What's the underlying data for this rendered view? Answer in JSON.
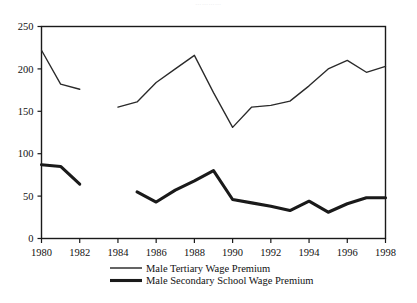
{
  "figure": {
    "faint_top_text": "…………",
    "background": "#ffffff",
    "ink_color": "#1a1a1a"
  },
  "chart_data": {
    "type": "line",
    "title": "",
    "xlabel": "",
    "ylabel": "",
    "xlim": [
      1980,
      1998
    ],
    "ylim": [
      0,
      250
    ],
    "grid": false,
    "legend_position": "bottom",
    "x_tick_labels": [
      "1980",
      "1982",
      "1984",
      "1986",
      "1988",
      "1990",
      "1992",
      "1994",
      "1996",
      "1998"
    ],
    "y_tick_labels": [
      "0",
      "50",
      "100",
      "150",
      "200",
      "250"
    ],
    "x_ticks": [
      1980,
      1982,
      1984,
      1986,
      1988,
      1990,
      1992,
      1994,
      1996,
      1998
    ],
    "y_ticks": [
      0,
      50,
      100,
      150,
      200,
      250
    ],
    "series": [
      {
        "name": "Male Tertiary Wage Premium",
        "line_style": "thin",
        "color": "#2a2a2a",
        "segments": [
          {
            "x": [
              1980,
              1981,
              1982
            ],
            "values": [
              222,
              182,
              176
            ]
          },
          {
            "x": [
              1984,
              1985,
              1986,
              1987,
              1988,
              1989,
              1990,
              1991,
              1992,
              1993,
              1994,
              1995,
              1996,
              1997,
              1998
            ],
            "values": [
              155,
              161,
              184,
              200,
              216,
              172,
              131,
              155,
              157,
              162,
              180,
              200,
              210,
              196,
              203
            ]
          }
        ]
      },
      {
        "name": "Male Secondary School Wage Premium",
        "line_style": "thick",
        "color": "#1a1a1a",
        "segments": [
          {
            "x": [
              1980,
              1981,
              1982
            ],
            "values": [
              87,
              85,
              64
            ]
          },
          {
            "x": [
              1985,
              1986,
              1987,
              1988,
              1989,
              1990,
              1991,
              1992,
              1993,
              1994,
              1995,
              1996,
              1997,
              1998
            ],
            "values": [
              55,
              43,
              57,
              68,
              80,
              46,
              42,
              38,
              33,
              44,
              31,
              41,
              48,
              48
            ]
          }
        ]
      }
    ]
  },
  "legend": {
    "entries": [
      {
        "label": "Male Tertiary Wage Premium",
        "style": "thin"
      },
      {
        "label": "Male Secondary School Wage Premium",
        "style": "thick"
      }
    ]
  }
}
